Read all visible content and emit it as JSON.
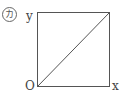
{
  "panel_label": "カ",
  "axes": {
    "y_label": "y",
    "x_label": "x",
    "origin_label": "O"
  },
  "figure": {
    "shape": "square",
    "diagonal": "from origin to top-right corner",
    "stroke_color": "#555555"
  }
}
